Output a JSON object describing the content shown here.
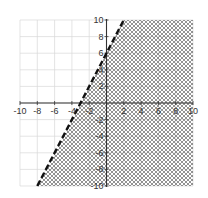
{
  "chart_data": {
    "type": "line",
    "title": "",
    "xlabel": "",
    "ylabel": "",
    "xlim": [
      -10,
      10
    ],
    "ylim": [
      -10,
      10
    ],
    "grid": true,
    "grid_step": 2,
    "x_ticks": [
      -10,
      -8,
      -6,
      -4,
      -2,
      2,
      4,
      6,
      8,
      10
    ],
    "y_ticks": [
      10,
      8,
      6,
      4,
      2,
      -2,
      -4,
      -6,
      -8,
      -10
    ],
    "x_tick_labels": [
      "-10",
      "-8",
      "-6",
      "-4",
      "-2",
      "2",
      "4",
      "6",
      "8",
      "10"
    ],
    "y_tick_labels": [
      "10",
      "8",
      "6",
      "4",
      "2",
      "-2",
      "-4",
      "-6",
      "-8",
      "-10"
    ],
    "series": [
      {
        "name": "boundary line",
        "equation": "y = 2x + 6",
        "style": "dashed",
        "color": "#111111",
        "x": [
          -8,
          2
        ],
        "y": [
          -10,
          10
        ]
      }
    ],
    "shaded_region": {
      "inequality": "y < 2x + 6",
      "side": "right/below line",
      "pattern": "crosshatch",
      "color": "#555555"
    },
    "legend": null
  },
  "colors": {
    "grid": "#d9d9d9",
    "axis": "#333333",
    "line": "#111111",
    "hatch": "#6a6a6a"
  }
}
